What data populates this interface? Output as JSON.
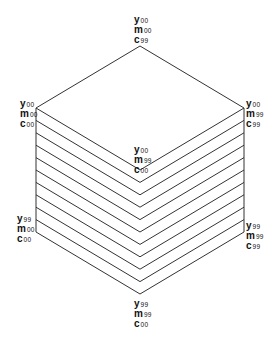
{
  "diagram": {
    "type": "color-cube-isometric",
    "stroke_color": "#333333",
    "slices": 11,
    "vertices": {
      "top": {
        "label": [
          {
            "ch": "y",
            "sub": "00"
          },
          {
            "ch": "m",
            "sub": "00"
          },
          {
            "ch": "c",
            "sub": "99"
          }
        ]
      },
      "upper_left": {
        "label": [
          {
            "ch": "y",
            "sub": "00"
          },
          {
            "ch": "m",
            "sub": "00"
          },
          {
            "ch": "c",
            "sub": "00"
          }
        ]
      },
      "upper_right": {
        "label": [
          {
            "ch": "y",
            "sub": "00"
          },
          {
            "ch": "m",
            "sub": "99"
          },
          {
            "ch": "c",
            "sub": "99"
          }
        ]
      },
      "center": {
        "label": [
          {
            "ch": "y",
            "sub": "00"
          },
          {
            "ch": "m",
            "sub": "99"
          },
          {
            "ch": "c",
            "sub": "00"
          }
        ]
      },
      "lower_left": {
        "label": [
          {
            "ch": "y",
            "sub": "99"
          },
          {
            "ch": "m",
            "sub": "00"
          },
          {
            "ch": "c",
            "sub": "00"
          }
        ]
      },
      "lower_right": {
        "label": [
          {
            "ch": "y",
            "sub": "99"
          },
          {
            "ch": "m",
            "sub": "99"
          },
          {
            "ch": "c",
            "sub": "99"
          }
        ]
      },
      "bottom": {
        "label": [
          {
            "ch": "y",
            "sub": "99"
          },
          {
            "ch": "m",
            "sub": "99"
          },
          {
            "ch": "c",
            "sub": "00"
          }
        ]
      }
    }
  }
}
